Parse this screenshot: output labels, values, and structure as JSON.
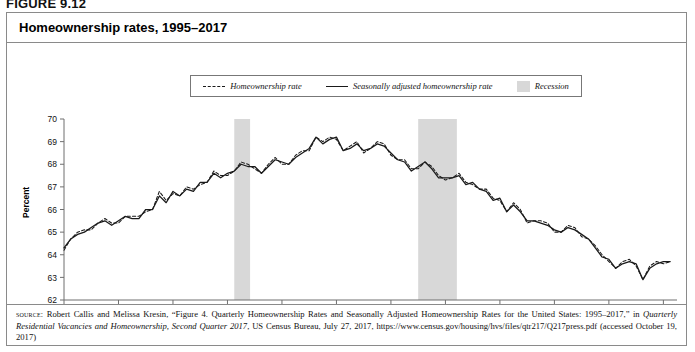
{
  "figure": {
    "number": "FIGURE 9.12"
  },
  "chart_title": "Homeownership rates, 1995–2017",
  "axis": {
    "ylabel": "Percent",
    "yticks": [
      "70",
      "69",
      "68",
      "67",
      "66",
      "65",
      "64",
      "63",
      "62"
    ],
    "xticks": [
      "1995",
      "1997",
      "1999",
      "2001",
      "2003",
      "2005",
      "2007",
      "2009",
      "2011",
      "2013",
      "2015",
      "2017"
    ]
  },
  "legend": {
    "items": [
      {
        "label": "Homeownership rate",
        "swatch": "dashed-line"
      },
      {
        "label": "Seasonally adjusted homeownership rate",
        "swatch": "solid-line"
      },
      {
        "label": "Recession",
        "swatch": "gray-band"
      }
    ]
  },
  "colors": {
    "line": "#1a1a1a",
    "recession_band": "#d8d8d8",
    "axis": "#6f6f6f",
    "border": "#8a8a8a"
  },
  "source": {
    "kicker": "source:",
    "text": " Robert Callis and Melissa Kresin, “Figure 4. Quarterly Homeownership Rates and Seasonally Adjusted Homeownership Rates for the United States: 1995–2017,” in ",
    "italic_title": "Quarterly Residential Vacancies and Homeownership, Second Quarter 2017",
    "text_tail": ", US Census Bureau, July 27, 2017, https://www.census.gov/housing/hvs/files/qtr217/Q217press.pdf (accessed October 19, 2017)"
  },
  "chart_data": {
    "type": "line",
    "title": "Homeownership rates, 1995–2017",
    "xlabel": "",
    "ylabel": "Percent",
    "ylim": [
      62,
      70
    ],
    "xlim": [
      1995.0,
      2017.5
    ],
    "grid": false,
    "legend_position": "top-center",
    "x": [
      1995.0,
      1995.25,
      1995.5,
      1995.75,
      1996.0,
      1996.25,
      1996.5,
      1996.75,
      1997.0,
      1997.25,
      1997.5,
      1997.75,
      1998.0,
      1998.25,
      1998.5,
      1998.75,
      1999.0,
      1999.25,
      1999.5,
      1999.75,
      2000.0,
      2000.25,
      2000.5,
      2000.75,
      2001.0,
      2001.25,
      2001.5,
      2001.75,
      2002.0,
      2002.25,
      2002.5,
      2002.75,
      2003.0,
      2003.25,
      2003.5,
      2003.75,
      2004.0,
      2004.25,
      2004.5,
      2004.75,
      2005.0,
      2005.25,
      2005.5,
      2005.75,
      2006.0,
      2006.25,
      2006.5,
      2006.75,
      2007.0,
      2007.25,
      2007.5,
      2007.75,
      2008.0,
      2008.25,
      2008.5,
      2008.75,
      2009.0,
      2009.25,
      2009.5,
      2009.75,
      2010.0,
      2010.25,
      2010.5,
      2010.75,
      2011.0,
      2011.25,
      2011.5,
      2011.75,
      2012.0,
      2012.25,
      2012.5,
      2012.75,
      2013.0,
      2013.25,
      2013.5,
      2013.75,
      2014.0,
      2014.25,
      2014.5,
      2014.75,
      2015.0,
      2015.25,
      2015.5,
      2015.75,
      2016.0,
      2016.25,
      2016.5,
      2016.75,
      2017.0,
      2017.25
    ],
    "series": [
      {
        "name": "Homeownership rate",
        "style": "dashed",
        "values": [
          64.2,
          64.7,
          65.0,
          65.1,
          65.1,
          65.4,
          65.6,
          65.4,
          65.4,
          65.7,
          65.7,
          65.7,
          65.9,
          66.0,
          66.8,
          66.4,
          66.7,
          66.6,
          67.0,
          66.9,
          67.1,
          67.2,
          67.7,
          67.5,
          67.5,
          67.7,
          68.1,
          68.0,
          67.8,
          67.6,
          68.0,
          68.3,
          68.0,
          68.0,
          68.4,
          68.6,
          68.6,
          69.2,
          69.0,
          69.2,
          69.1,
          68.6,
          68.8,
          69.0,
          68.5,
          68.7,
          69.0,
          68.9,
          68.4,
          68.2,
          68.2,
          67.8,
          67.8,
          68.1,
          67.9,
          67.5,
          67.3,
          67.4,
          67.6,
          67.2,
          67.1,
          66.9,
          66.9,
          66.5,
          66.4,
          65.9,
          66.3,
          66.0,
          65.4,
          65.5,
          65.5,
          65.4,
          65.0,
          65.0,
          65.3,
          65.2,
          64.8,
          64.7,
          64.4,
          64.0,
          63.7,
          63.4,
          63.7,
          63.8,
          63.5,
          62.9,
          63.5,
          63.7,
          63.6,
          63.7
        ]
      },
      {
        "name": "Seasonally adjusted homeownership rate",
        "style": "solid",
        "values": [
          64.3,
          64.7,
          64.9,
          65.0,
          65.2,
          65.4,
          65.5,
          65.3,
          65.5,
          65.7,
          65.6,
          65.6,
          66.0,
          66.0,
          66.6,
          66.3,
          66.8,
          66.6,
          66.9,
          66.8,
          67.2,
          67.2,
          67.6,
          67.4,
          67.6,
          67.7,
          68.0,
          67.9,
          67.9,
          67.6,
          67.9,
          68.2,
          68.1,
          68.0,
          68.3,
          68.5,
          68.7,
          69.2,
          68.9,
          69.1,
          69.2,
          68.6,
          68.7,
          68.9,
          68.6,
          68.7,
          68.9,
          68.8,
          68.5,
          68.2,
          68.1,
          67.7,
          67.9,
          68.1,
          67.8,
          67.4,
          67.4,
          67.4,
          67.5,
          67.1,
          67.2,
          66.9,
          66.8,
          66.4,
          66.5,
          65.9,
          66.2,
          65.9,
          65.5,
          65.5,
          65.4,
          65.3,
          65.1,
          65.0,
          65.2,
          65.1,
          64.9,
          64.7,
          64.3,
          63.9,
          63.8,
          63.4,
          63.6,
          63.7,
          63.6,
          62.9,
          63.4,
          63.6,
          63.7,
          63.7
        ]
      }
    ],
    "recessions": [
      {
        "start": 2001.25,
        "end": 2001.83,
        "label": "Recession"
      },
      {
        "start": 2008.0,
        "end": 2009.42,
        "label": "Recession"
      }
    ]
  }
}
